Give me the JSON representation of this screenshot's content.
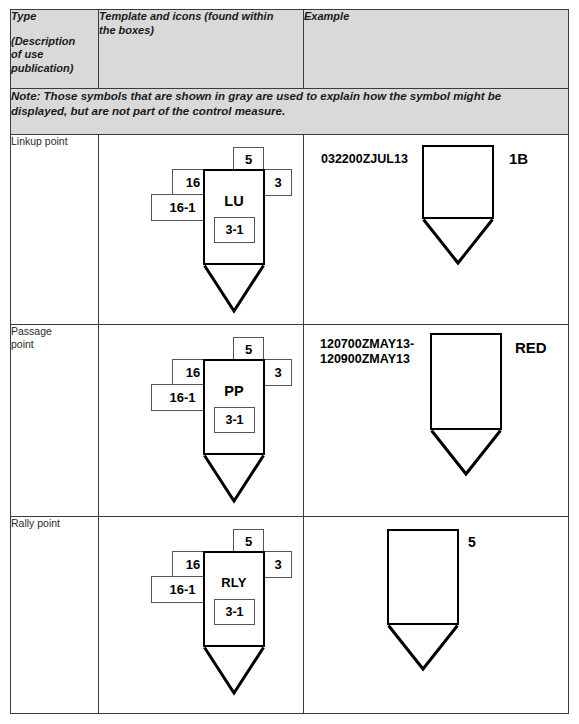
{
  "table": {
    "headers": {
      "type": {
        "title": "Type",
        "sub_line1": "(Description",
        "sub_line2": "of use",
        "sub_line3": "publication)"
      },
      "template": {
        "line1": "Template and icons (found within",
        "line2": "the boxes)"
      },
      "example": "Example"
    },
    "note": {
      "line1": "Note: Those symbols that are shown in gray are used to explain how the symbol might be",
      "line2": "displayed, but are not part of the control measure."
    },
    "rows": [
      {
        "type": "Linkup point",
        "template": {
          "abbreviation": "LU",
          "amp_top": "5",
          "amp_left": "16",
          "amp_right": "3",
          "amp_lower_left": "16-1",
          "amp_inner": "3-1"
        },
        "example": {
          "abbreviation": "LU",
          "unit": "3BCT",
          "dtg": "032200ZJUL13",
          "right_label": "1B"
        }
      },
      {
        "type": "Passage\npoint",
        "template": {
          "abbreviation": "PP",
          "amp_top": "5",
          "amp_left": "16",
          "amp_right": "3",
          "amp_lower_left": "16-1",
          "amp_inner": "3-1"
        },
        "example": {
          "abbreviation": "PP",
          "unit": "2-31IN",
          "dtg": "120700ZMAY13-\n120900ZMAY13",
          "right_label": "RED"
        }
      },
      {
        "type": "Rally point",
        "template": {
          "abbreviation": "RLY",
          "amp_top": "5",
          "amp_left": "16",
          "amp_right": "3",
          "amp_lower_left": "16-1",
          "amp_inner": "3-1"
        },
        "example": {
          "abbreviation": "RLY",
          "unit": "A TRP",
          "dtg": "",
          "right_label": "5"
        }
      }
    ]
  },
  "colors": {
    "header_background": "#d9d9d9",
    "border": "#3b3b3b",
    "symbol_stroke": "#000000",
    "amplifier_stroke": "#555555",
    "text": "#1a1a1a"
  }
}
